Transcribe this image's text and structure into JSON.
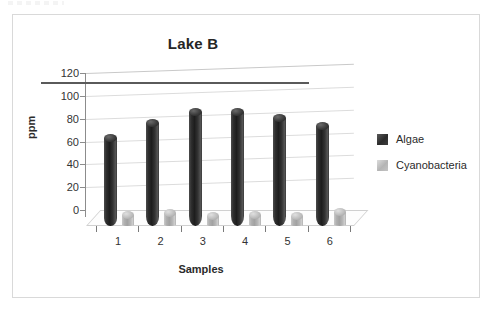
{
  "chart_data": {
    "type": "bar",
    "title": "Lake B",
    "xlabel": "Samples",
    "ylabel": "ppm",
    "categories": [
      "1",
      "2",
      "3",
      "4",
      "5",
      "6"
    ],
    "yticks": [
      "0",
      "20",
      "40",
      "60",
      "80",
      "100",
      "120"
    ],
    "ylim": [
      0,
      120
    ],
    "grid": true,
    "legend_position": "right",
    "series": [
      {
        "name": "Algae",
        "color": "#2e2e2e",
        "values": [
          81,
          94,
          103,
          103,
          98,
          91
        ]
      },
      {
        "name": "Cyanobacteria",
        "color": "#b4b4b4",
        "values": [
          13,
          15,
          12,
          13,
          12,
          16
        ]
      }
    ]
  },
  "legend": {
    "items": [
      {
        "label": "Algae"
      },
      {
        "label": "Cyanobacteria"
      }
    ]
  }
}
